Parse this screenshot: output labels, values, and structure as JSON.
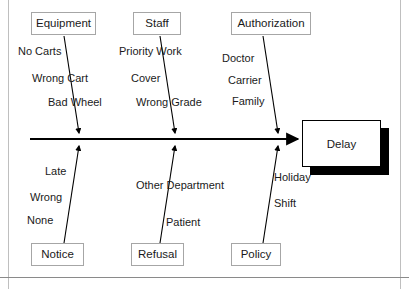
{
  "diagram": {
    "type": "fishbone-ishikawa",
    "effect": {
      "label": "Delay"
    },
    "categories_top": [
      {
        "name": "Equipment",
        "causes": [
          "No Carts",
          "Wrong Cart",
          "Bad Wheel"
        ]
      },
      {
        "name": "Staff",
        "causes": [
          "Priority Work",
          "Cover",
          "Wrong Grade"
        ]
      },
      {
        "name": "Authorization",
        "causes": [
          "Doctor",
          "Carrier",
          "Family"
        ]
      }
    ],
    "categories_bottom": [
      {
        "name": "Notice",
        "causes": [
          "Late",
          "Wrong",
          "None"
        ]
      },
      {
        "name": "Refusal",
        "causes": [
          "Other Department",
          "Patient"
        ]
      },
      {
        "name": "Policy",
        "causes": [
          "Holiday",
          "Shift"
        ]
      }
    ],
    "colors": {
      "line": "#000000",
      "box_border": "#a6a6a6",
      "effect_border": "#000000",
      "shadow": "#000000",
      "page_rule": "#bfbfbf",
      "text": "#1a1a1a",
      "background": "#ffffff"
    },
    "labels": {
      "equipment_box": "Equipment",
      "staff_box": "Staff",
      "authorization_box": "Authorization",
      "notice_box": "Notice",
      "refusal_box": "Refusal",
      "policy_box": "Policy",
      "no_carts": "No Carts",
      "wrong_cart": "Wrong Cart",
      "bad_wheel": "Bad Wheel",
      "priority_work": "Priority Work",
      "cover": "Cover",
      "wrong_grade": "Wrong Grade",
      "doctor": "Doctor",
      "carrier": "Carrier",
      "family": "Family",
      "late": "Late",
      "wrong": "Wrong",
      "none": "None",
      "other_department": "Other Department",
      "patient": "Patient",
      "holiday": "Holiday",
      "shift": "Shift"
    }
  }
}
